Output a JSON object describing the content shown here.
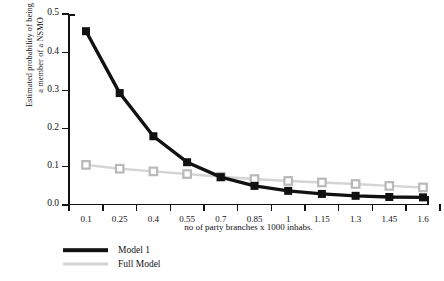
{
  "chart_data": {
    "type": "line",
    "title": "",
    "xlabel": "no of party branches x 1000 inhabs.",
    "ylabel_line1": "Estimated probability of being",
    "ylabel_line2": "a member of a NSMO",
    "categories": [
      "0.1",
      "0.25",
      "0.4",
      "0.55",
      "0.7",
      "0.85",
      "1",
      "1.15",
      "1.3",
      "1.45",
      "1.6"
    ],
    "x": [
      0.1,
      0.25,
      0.4,
      0.55,
      0.7,
      0.85,
      1,
      1.15,
      1.3,
      1.45,
      1.6
    ],
    "ylim": [
      0.0,
      0.5
    ],
    "yticks": [
      "0.0",
      "0.1",
      "0.2",
      "0.3",
      "0.4",
      "0.5"
    ],
    "ytick_values": [
      0.0,
      0.1,
      0.2,
      0.3,
      0.4,
      0.5
    ],
    "grid": false,
    "legend_position": "below-left",
    "series": [
      {
        "name": "Model 1",
        "color": "#111111",
        "marker": "filled-square",
        "values": [
          0.455,
          0.293,
          0.18,
          0.112,
          0.073,
          0.05,
          0.037,
          0.029,
          0.024,
          0.021,
          0.02
        ]
      },
      {
        "name": "Full Model",
        "color": "#d4d4d4",
        "marker": "open-square",
        "values": [
          0.105,
          0.095,
          0.088,
          0.081,
          0.074,
          0.068,
          0.063,
          0.059,
          0.055,
          0.05,
          0.046
        ]
      }
    ]
  },
  "legend": {
    "items": [
      {
        "label": "Model 1"
      },
      {
        "label": "Full Model"
      }
    ]
  },
  "colors": {
    "model1": "#111111",
    "full_model": "#d4d4d4",
    "axis": "#111111",
    "background": "#ffffff"
  }
}
